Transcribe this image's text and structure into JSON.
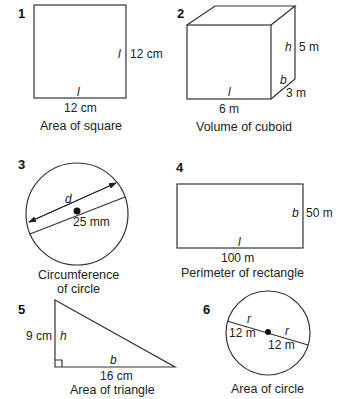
{
  "figures": [
    {
      "number": "1",
      "caption": "Area of square",
      "side_var": "l",
      "side_value": "12 cm",
      "bottom_var": "l",
      "bottom_value": "12 cm"
    },
    {
      "number": "2",
      "caption": "Volume of cuboid",
      "height_var": "h",
      "height_value": "5 m",
      "breadth_var": "b",
      "breadth_value": "3 m",
      "length_var": "l",
      "length_value": "6 m"
    },
    {
      "number": "3",
      "caption_line1": "Circumference",
      "caption_line2": "of circle",
      "diameter_var": "d",
      "diameter_value": "25 mm"
    },
    {
      "number": "4",
      "caption": "Perimeter of rectangle",
      "breadth_var": "b",
      "breadth_value": "50 m",
      "length_var": "l",
      "length_value": "100 m"
    },
    {
      "number": "5",
      "caption": "Area of triangle",
      "height_var": "h",
      "height_value": "9 cm",
      "base_var": "b",
      "base_value": "16 cm"
    },
    {
      "number": "6",
      "caption": "Area of circle",
      "radius_var_left": "r",
      "radius_value_left": "12 m",
      "radius_var_right": "r",
      "radius_value_right": "12 m"
    }
  ]
}
